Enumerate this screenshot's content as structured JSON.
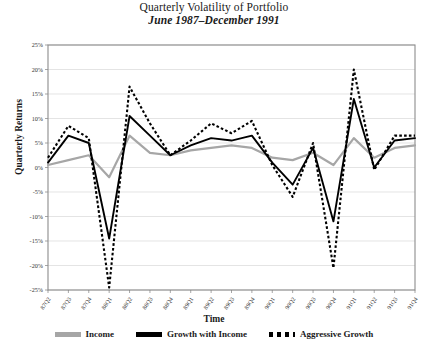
{
  "title": {
    "main": "Quarterly Volatility of Portfolio",
    "subtitle": "June 1987–December 1991"
  },
  "axes": {
    "ylabel": "Quarterly Returns",
    "xlabel": "Time"
  },
  "legend": {
    "items": [
      {
        "label": "Income",
        "color": "#a6a6a6",
        "style": "solid"
      },
      {
        "label": "Growth with Income",
        "color": "#000000",
        "style": "solid"
      },
      {
        "label": "Aggressive Growth",
        "color": "#000000",
        "style": "dotted"
      }
    ]
  },
  "chart_data": {
    "type": "line",
    "title": "Quarterly Volatility of Portfolio",
    "subtitle": "June 1987–December 1991",
    "xlabel": "Time",
    "ylabel": "Quarterly Returns",
    "ylim": [
      -25,
      25
    ],
    "ytick_labels": [
      "25%",
      "20%",
      "15%",
      "10%",
      "5%",
      "0%",
      "-5%",
      "-10%",
      "-15%",
      "-20%",
      "-25%"
    ],
    "ytick_values": [
      25,
      20,
      15,
      10,
      5,
      0,
      -5,
      -10,
      -15,
      -20,
      -25
    ],
    "grid": true,
    "legend_position": "bottom",
    "categories": [
      "87Q2",
      "87Q3",
      "87Q4",
      "88Q1",
      "88Q2",
      "88Q3",
      "88Q4",
      "89Q1",
      "89Q2",
      "89Q3",
      "89Q4",
      "90Q1",
      "90Q2",
      "90Q3",
      "90Q4",
      "91Q1",
      "91Q2",
      "91Q3",
      "91Q4"
    ],
    "series": [
      {
        "name": "Income",
        "color": "#a6a6a6",
        "style": "solid",
        "values": [
          0.5,
          1.5,
          2.5,
          -2.0,
          6.5,
          3.0,
          2.5,
          3.5,
          4.0,
          4.5,
          4.0,
          2.0,
          1.5,
          3.0,
          0.5,
          6.0,
          2.0,
          4.0,
          4.5
        ]
      },
      {
        "name": "Growth with Income",
        "color": "#000000",
        "style": "solid",
        "values": [
          1.0,
          6.5,
          5.0,
          -14.5,
          10.5,
          6.5,
          2.5,
          4.5,
          6.0,
          5.5,
          6.5,
          1.0,
          -3.5,
          4.0,
          -11.0,
          14.0,
          0.0,
          5.5,
          6.0
        ]
      },
      {
        "name": "Aggressive Growth",
        "color": "#000000",
        "style": "dotted",
        "values": [
          2.0,
          8.5,
          6.0,
          -24.5,
          16.5,
          9.0,
          2.5,
          5.5,
          9.0,
          7.0,
          9.5,
          0.5,
          -6.0,
          5.0,
          -20.5,
          20.0,
          -0.5,
          6.5,
          6.5
        ]
      }
    ]
  }
}
